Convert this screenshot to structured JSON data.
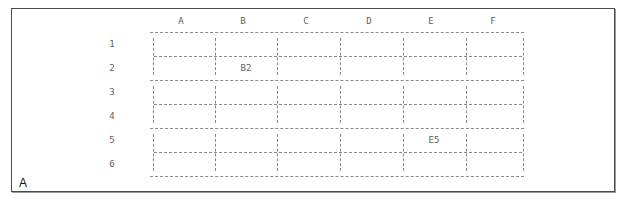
{
  "panel": {
    "label": "A"
  },
  "grid": {
    "columns": [
      "A",
      "B",
      "C",
      "D",
      "E",
      "F"
    ],
    "rows": [
      "1",
      "2",
      "3",
      "4",
      "5",
      "6"
    ],
    "labeled_cells": [
      {
        "cell": "B2",
        "text": "B2"
      },
      {
        "cell": "E5",
        "text": "E5"
      }
    ]
  },
  "colors": {
    "border": "#4a4a4a",
    "grid_lines": "#8a8a8a",
    "text": "#5e5e5e",
    "panel_label": "#111111"
  }
}
